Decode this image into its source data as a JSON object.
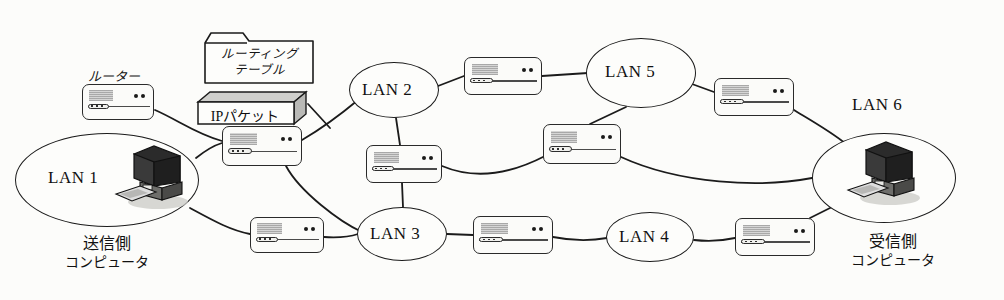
{
  "diagram": {
    "background_color": "#fcfcfa",
    "line_color": "#1b1b1b"
  },
  "labels": {
    "router_label": "ルーター",
    "routing_table_line1": "ルーティング",
    "routing_table_line2": "テーブル",
    "ip_packet": "IPパケット",
    "sender_line1": "送信側",
    "sender_line2": "コンピュータ",
    "receiver_line1": "受信側",
    "receiver_line2": "コンピュータ"
  },
  "lans": [
    {
      "id": "lan1",
      "label": "LAN 1",
      "cx": 107,
      "cy": 180,
      "rx": 92,
      "ry": 47,
      "label_x": 48,
      "label_y": 168,
      "has_computer": true
    },
    {
      "id": "lan2",
      "label": "LAN 2",
      "cx": 394,
      "cy": 90,
      "rx": 45,
      "ry": 28,
      "label_x": 362,
      "label_y": 80,
      "has_computer": false
    },
    {
      "id": "lan3",
      "label": "LAN 3",
      "cx": 402,
      "cy": 234,
      "rx": 45,
      "ry": 27,
      "label_x": 370,
      "label_y": 224,
      "has_computer": false
    },
    {
      "id": "lan4",
      "label": "LAN 4",
      "cx": 650,
      "cy": 237,
      "rx": 44,
      "ry": 25,
      "label_x": 619,
      "label_y": 227,
      "has_computer": false
    },
    {
      "id": "lan5",
      "label": "LAN 5",
      "cx": 641,
      "cy": 73,
      "rx": 55,
      "ry": 35,
      "label_x": 605,
      "label_y": 62,
      "has_computer": false
    },
    {
      "id": "lan6",
      "label": "LAN 6",
      "cx": 884,
      "cy": 178,
      "rx": 72,
      "ry": 45,
      "label_x": 852,
      "label_y": 95,
      "has_computer": true
    }
  ],
  "routers": [
    {
      "id": "r-legend",
      "x": 82,
      "y": 84,
      "w": 72,
      "h": 36
    },
    {
      "id": "r-lan1-top",
      "x": 222,
      "y": 126,
      "w": 80,
      "h": 40
    },
    {
      "id": "r-lan1-bottom",
      "x": 250,
      "y": 217,
      "w": 74,
      "h": 36
    },
    {
      "id": "r-lan2-south",
      "x": 366,
      "y": 145,
      "w": 76,
      "h": 38
    },
    {
      "id": "r-lan2-lan5",
      "x": 464,
      "y": 57,
      "w": 78,
      "h": 38
    },
    {
      "id": "r-mid",
      "x": 543,
      "y": 124,
      "w": 78,
      "h": 40
    },
    {
      "id": "r-lan3-lan4",
      "x": 473,
      "y": 216,
      "w": 80,
      "h": 38
    },
    {
      "id": "r-lan5-lan6",
      "x": 714,
      "y": 78,
      "w": 80,
      "h": 38
    },
    {
      "id": "r-lan4-lan6",
      "x": 735,
      "y": 218,
      "w": 80,
      "h": 38
    }
  ],
  "computers": [
    {
      "id": "computer-sender",
      "x": 110,
      "y": 142,
      "w": 82,
      "h": 72
    },
    {
      "id": "computer-receiver",
      "x": 842,
      "y": 138,
      "w": 82,
      "h": 72
    }
  ],
  "annotations": {
    "router_legend_label_x": 88,
    "router_legend_label_y": 66,
    "routing_table": {
      "x": 203,
      "y": 31,
      "w": 112,
      "h": 54
    },
    "ip_packet": {
      "x": 196,
      "y": 90,
      "w": 112,
      "h": 34
    },
    "sender_caption": {
      "x": 42,
      "y": 234,
      "w": 130
    },
    "receiver_caption": {
      "x": 828,
      "y": 232,
      "w": 130
    }
  },
  "links": [
    {
      "from": "r-legend",
      "to": "lan1",
      "path": "M 155 110 C 178 120 196 134 222 141"
    },
    {
      "from": "lan1",
      "to": "r-lan1-top",
      "path": "M 196 158 C 206 150 212 146 222 143"
    },
    {
      "from": "lan1",
      "to": "r-lan1-bottom",
      "path": "M 190 208 C 214 221 230 230 250 234"
    },
    {
      "from": "r-lan1-top",
      "to": "lan2",
      "path": "M 302 140 C 326 126 346 110 358 100"
    },
    {
      "from": "r-lan1-top",
      "to": "lan3",
      "path": "M 286 166 C 300 192 340 222 362 232"
    },
    {
      "from": "lan2",
      "to": "r-lan2-south",
      "path": "M 396 118 L 400 145"
    },
    {
      "from": "lan2",
      "to": "r-lan2-lan5",
      "path": "M 438 86 L 464 76"
    },
    {
      "from": "r-lan2-lan5",
      "to": "lan5",
      "path": "M 542 76 L 588 73"
    },
    {
      "from": "r-lan2-south",
      "to": "lan3",
      "path": "M 402 183 L 403 207"
    },
    {
      "from": "r-lan2-south",
      "to": "r-mid",
      "path": "M 442 166 C 480 182 518 170 545 156"
    },
    {
      "from": "lan5",
      "to": "r-mid",
      "path": "M 626 107 L 590 124"
    },
    {
      "from": "r-mid",
      "to": "lan6",
      "path": "M 621 157 C 680 184 760 188 812 178"
    },
    {
      "from": "lan5",
      "to": "r-lan5-lan6",
      "path": "M 692 84 L 714 92"
    },
    {
      "from": "r-lan5-lan6",
      "to": "lan6",
      "path": "M 794 110 C 820 126 838 136 848 146"
    },
    {
      "from": "r-lan1-bottom",
      "to": "lan3",
      "path": "M 324 237 C 340 238 352 236 358 234"
    },
    {
      "from": "lan3",
      "to": "r-lan3-lan4",
      "path": "M 447 234 L 473 235"
    },
    {
      "from": "r-lan3-lan4",
      "to": "lan4",
      "path": "M 553 237 C 578 242 596 240 607 238"
    },
    {
      "from": "lan4",
      "to": "r-lan4-lan6",
      "path": "M 694 240 C 712 242 726 240 735 238"
    },
    {
      "from": "r-lan4-lan6",
      "to": "lan6",
      "path": "M 810 218 C 822 212 834 206 846 200"
    },
    {
      "from": "ip-packet",
      "to": "r-lan1-top",
      "path": "M 308 104 L 330 128"
    }
  ]
}
